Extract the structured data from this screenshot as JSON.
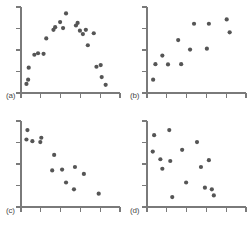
{
  "figure": {
    "panel_label_a": "(a)",
    "panel_label_b": "(b)",
    "panel_label_c": "(c)",
    "panel_label_d": "(d)",
    "colors": {
      "point": "#555555",
      "axis": "#7a7a7a",
      "label": "#4a4a4a",
      "background": "#ffffff"
    }
  },
  "chart_data": [
    {
      "type": "scatter",
      "title": "(a)",
      "xlabel": "",
      "ylabel": "",
      "xlim": [
        0,
        10
      ],
      "ylim": [
        0,
        10
      ],
      "grid": false,
      "legend": false,
      "x_ticks": [
        0,
        2,
        4,
        6,
        8,
        10
      ],
      "y_ticks": [
        0,
        2.5,
        5,
        7.5,
        10
      ],
      "series": [
        {
          "name": "quadratic",
          "points": [
            [
              0.55,
              1.05
            ],
            [
              0.72,
              1.55
            ],
            [
              0.78,
              2.95
            ],
            [
              1.35,
              4.45
            ],
            [
              1.72,
              4.62
            ],
            [
              2.28,
              4.55
            ],
            [
              2.55,
              6.35
            ],
            [
              3.28,
              7.35
            ],
            [
              3.45,
              7.65
            ],
            [
              3.95,
              8.25
            ],
            [
              4.25,
              7.55
            ],
            [
              4.55,
              9.25
            ],
            [
              5.55,
              7.85
            ],
            [
              5.72,
              8.15
            ],
            [
              5.95,
              7.25
            ],
            [
              6.25,
              6.85
            ],
            [
              6.55,
              7.35
            ],
            [
              6.75,
              5.55
            ],
            [
              7.35,
              6.95
            ],
            [
              7.62,
              3.05
            ],
            [
              8.05,
              3.25
            ],
            [
              8.15,
              1.85
            ],
            [
              8.55,
              0.95
            ]
          ]
        }
      ]
    },
    {
      "type": "scatter",
      "title": "(b)",
      "xlabel": "",
      "ylabel": "",
      "xlim": [
        0,
        10
      ],
      "ylim": [
        0,
        10
      ],
      "grid": false,
      "legend": false,
      "x_ticks": [
        0,
        2,
        4,
        6,
        8,
        10
      ],
      "y_ticks": [
        0,
        2.5,
        5,
        7.5,
        10
      ],
      "series": [
        {
          "name": "positive-linear",
          "points": [
            [
              0.62,
              1.55
            ],
            [
              0.85,
              3.35
            ],
            [
              1.55,
              4.35
            ],
            [
              2.12,
              3.32
            ],
            [
              3.15,
              6.15
            ],
            [
              3.45,
              3.35
            ],
            [
              4.35,
              5.05
            ],
            [
              4.75,
              8.05
            ],
            [
              6.05,
              5.15
            ],
            [
              6.25,
              8.05
            ],
            [
              8.05,
              8.55
            ],
            [
              8.35,
              7.05
            ]
          ]
        }
      ]
    },
    {
      "type": "scatter",
      "title": "(c)",
      "xlabel": "",
      "ylabel": "",
      "xlim": [
        0,
        10
      ],
      "ylim": [
        0,
        10
      ],
      "grid": false,
      "legend": false,
      "x_ticks": [
        0,
        2,
        4,
        6,
        8,
        10
      ],
      "y_ticks": [
        0,
        2.5,
        5,
        7.5,
        10
      ],
      "series": [
        {
          "name": "negative-linear",
          "points": [
            [
              0.65,
              8.95
            ],
            [
              0.55,
              7.85
            ],
            [
              1.15,
              7.65
            ],
            [
              1.95,
              7.55
            ],
            [
              2.05,
              8.05
            ],
            [
              3.35,
              6.05
            ],
            [
              3.15,
              4.25
            ],
            [
              4.15,
              4.35
            ],
            [
              4.55,
              2.85
            ],
            [
              5.45,
              4.65
            ],
            [
              5.35,
              2.05
            ],
            [
              6.35,
              3.85
            ],
            [
              7.85,
              1.55
            ]
          ]
        }
      ]
    },
    {
      "type": "scatter",
      "title": "(d)",
      "xlabel": "",
      "ylabel": "",
      "xlim": [
        0,
        10
      ],
      "ylim": [
        0,
        10
      ],
      "grid": false,
      "legend": false,
      "x_ticks": [
        0,
        2,
        4,
        6,
        8,
        10
      ],
      "y_ticks": [
        0,
        2.5,
        5,
        7.5,
        10
      ],
      "series": [
        {
          "name": "no-correlation",
          "points": [
            [
              0.72,
              8.35
            ],
            [
              0.58,
              6.45
            ],
            [
              1.35,
              5.55
            ],
            [
              1.55,
              4.45
            ],
            [
              2.25,
              8.95
            ],
            [
              2.35,
              5.35
            ],
            [
              2.55,
              1.15
            ],
            [
              3.55,
              6.65
            ],
            [
              3.95,
              2.85
            ],
            [
              5.05,
              7.55
            ],
            [
              5.45,
              4.65
            ],
            [
              5.85,
              2.25
            ],
            [
              6.25,
              5.45
            ],
            [
              6.55,
              2.05
            ],
            [
              6.75,
              1.35
            ]
          ]
        }
      ]
    }
  ]
}
